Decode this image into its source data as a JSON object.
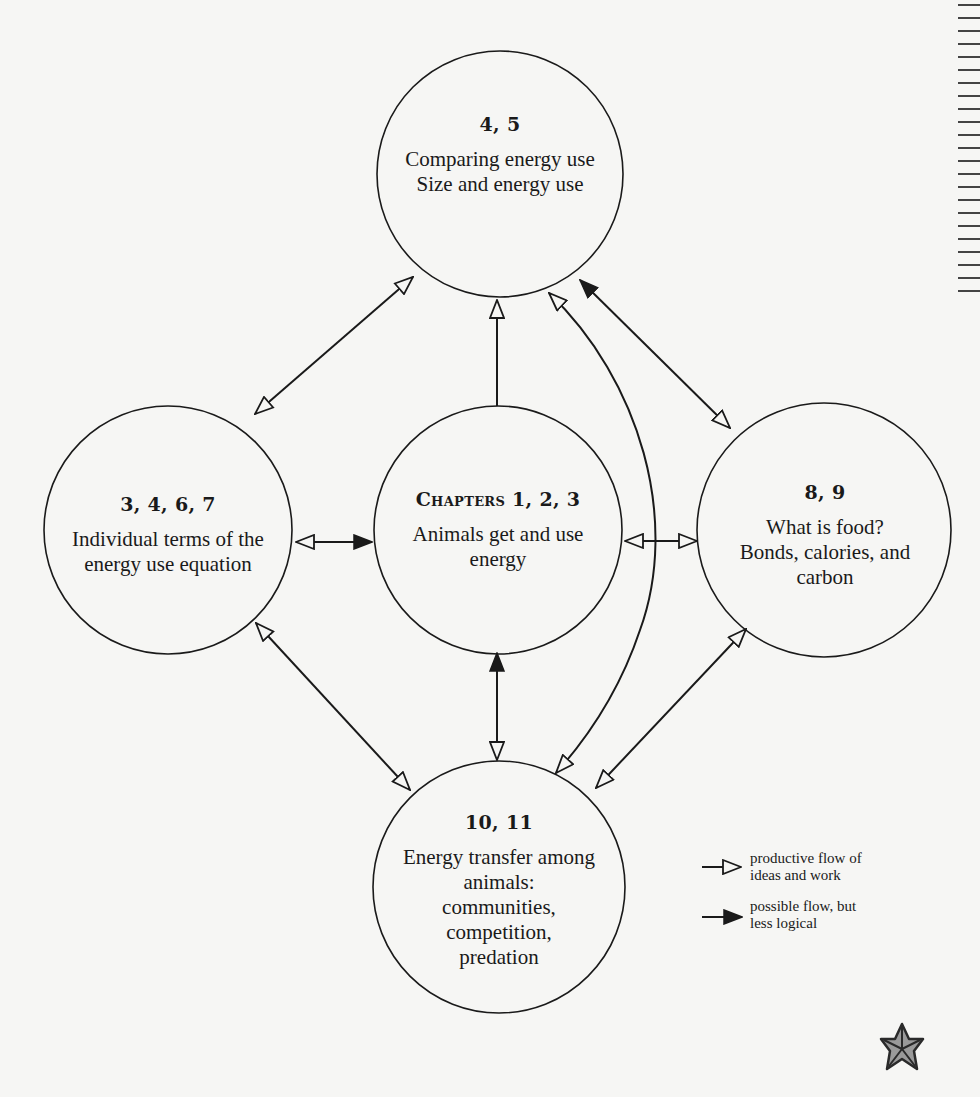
{
  "nodes": {
    "top": {
      "number": "4, 5",
      "lines": [
        "Comparing energy use",
        "Size and energy use"
      ]
    },
    "left": {
      "number": "3, 4, 6, 7",
      "lines": [
        "Individual terms of the",
        "energy use equation"
      ]
    },
    "center": {
      "prefix": "Chapters",
      "number": "1, 2, 3",
      "lines": [
        "Animals get and use",
        "energy"
      ]
    },
    "right": {
      "number": "8, 9",
      "lines": [
        "What is food?",
        "Bonds, calories, and",
        "carbon"
      ]
    },
    "bottom": {
      "number": "10, 11",
      "lines": [
        "Energy transfer among",
        "animals:",
        "communities,",
        "competition,",
        "predation"
      ]
    }
  },
  "legend": {
    "open": {
      "line1": "productive flow of",
      "line2": "ideas and work"
    },
    "filled": {
      "line1": "possible flow, but",
      "line2": "less logical"
    }
  },
  "edges": [
    {
      "from": "left",
      "to": "top",
      "from_head": "open",
      "to_head": "open"
    },
    {
      "from": "center",
      "to": "top",
      "from_head": "none",
      "to_head": "open"
    },
    {
      "from": "top",
      "to": "bottom",
      "from_head": "open",
      "to_head": "open",
      "shape": "curve"
    },
    {
      "from": "top",
      "to": "right",
      "from_head": "filled",
      "to_head": "open"
    },
    {
      "from": "left",
      "to": "center",
      "from_head": "open",
      "to_head": "filled"
    },
    {
      "from": "center",
      "to": "right",
      "from_head": "open",
      "to_head": "open"
    },
    {
      "from": "left",
      "to": "bottom",
      "from_head": "open",
      "to_head": "open"
    },
    {
      "from": "center",
      "to": "bottom",
      "from_head": "filled",
      "to_head": "open"
    },
    {
      "from": "right",
      "to": "bottom",
      "from_head": "open",
      "to_head": "open"
    }
  ],
  "icons": {
    "corner": "starfish-icon"
  },
  "colors": {
    "line": "#1a1a1a",
    "background": "#f6f6f4"
  }
}
